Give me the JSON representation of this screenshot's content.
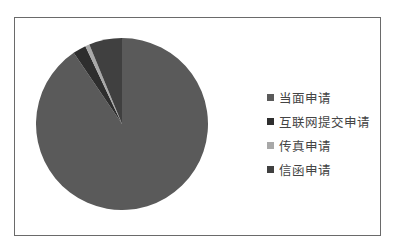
{
  "chart_data": {
    "type": "pie",
    "title": "",
    "start_angle_deg": 0,
    "direction": "clockwise",
    "legend_position": "right",
    "categories": [
      "当面申请",
      "互联网提交申请",
      "传真申请",
      "信函申请"
    ],
    "values": [
      90.5,
      2.5,
      0.8,
      6.2
    ],
    "colors": [
      "#5a5a5a",
      "#2e2e2e",
      "#a8a8a8",
      "#404040"
    ]
  },
  "legend": {
    "items": [
      {
        "label": "当面申请",
        "color": "#5a5a5a"
      },
      {
        "label": "互联网提交申请",
        "color": "#2e2e2e"
      },
      {
        "label": "传真申请",
        "color": "#a8a8a8"
      },
      {
        "label": "信函申请",
        "color": "#404040"
      }
    ]
  }
}
